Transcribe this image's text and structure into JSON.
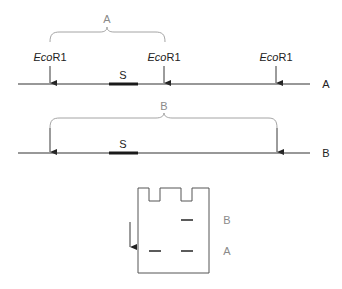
{
  "figure": {
    "map_a": {
      "label": "A",
      "brace_label": "A",
      "segment_label": "S",
      "sites": [
        {
          "enzyme_italic": "Eco",
          "enzyme_rest": "R1"
        },
        {
          "enzyme_italic": "Eco",
          "enzyme_rest": "R1"
        },
        {
          "enzyme_italic": "Eco",
          "enzyme_rest": "R1"
        }
      ]
    },
    "map_b": {
      "label": "B",
      "brace_label": "B",
      "segment_label": "S"
    },
    "gel": {
      "lanes": 2,
      "band_labels": {
        "upper": "B",
        "lower": "A"
      },
      "direction": "down"
    },
    "colors": {
      "line": "#333333",
      "brace": "#9a9a9a",
      "brace_label": "#8a8a8a"
    }
  }
}
